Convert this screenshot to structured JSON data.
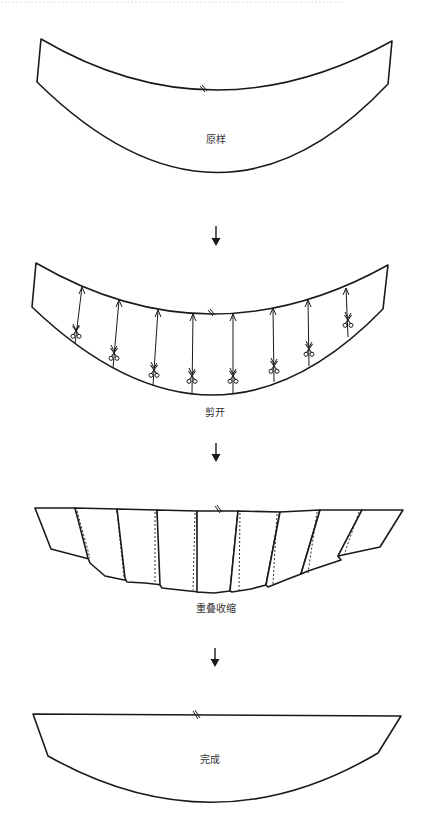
{
  "caption": {
    "top_fragment": "………………………………………………………………………………"
  },
  "steps": [
    {
      "id": "original",
      "label": "原样"
    },
    {
      "id": "cut",
      "label": "剪开"
    },
    {
      "id": "overlap",
      "label": "重叠收缩"
    },
    {
      "id": "done",
      "label": "完成"
    }
  ],
  "icons": {
    "flow_arrow": "down-arrow-icon",
    "scissors": "scissors-icon",
    "notch": "notch-mark-icon"
  },
  "cut_count": 8,
  "colors": {
    "line": "#1a1a1a",
    "label": "#333333",
    "background": "#ffffff"
  }
}
